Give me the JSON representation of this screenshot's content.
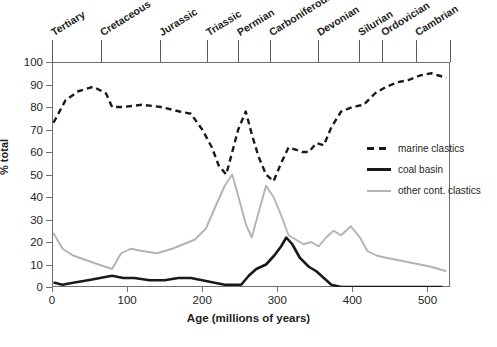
{
  "chart_data": {
    "type": "line",
    "title": "",
    "xlabel": "Age (millions of years)",
    "ylabel": "% total",
    "xlim": [
      0,
      530
    ],
    "ylim": [
      0,
      100
    ],
    "xticks": [
      0,
      100,
      200,
      300,
      400,
      500
    ],
    "yticks": [
      0,
      10,
      20,
      30,
      40,
      50,
      60,
      70,
      80,
      90,
      100
    ],
    "grid": false,
    "legend_position": "right-middle",
    "series": [
      {
        "name": "marine clastics",
        "style": "dashed",
        "color": "#1a1a1a",
        "x": [
          2,
          18,
          35,
          55,
          72,
          80,
          95,
          120,
          145,
          170,
          185,
          200,
          213,
          222,
          232,
          240,
          248,
          258,
          266,
          275,
          285,
          295,
          305,
          315,
          325,
          333,
          342,
          352,
          362,
          372,
          385,
          400,
          415,
          430,
          445,
          460,
          475,
          490,
          505,
          515,
          525
        ],
        "y": [
          73,
          83,
          87,
          89,
          86,
          80,
          80,
          81,
          80,
          78,
          77,
          70,
          62,
          54,
          50,
          60,
          70,
          78,
          68,
          58,
          50,
          47,
          55,
          62,
          61,
          60,
          60,
          64,
          63,
          71,
          78,
          80,
          81,
          86,
          89,
          91,
          92,
          94,
          95,
          94,
          93
        ]
      },
      {
        "name": "coal basin",
        "style": "solid",
        "color": "#1a1a1a",
        "x": [
          2,
          14,
          30,
          48,
          64,
          80,
          95,
          110,
          130,
          150,
          168,
          185,
          200,
          215,
          230,
          245,
          252,
          262,
          272,
          285,
          296,
          305,
          312,
          320,
          330,
          342,
          352,
          362,
          372,
          385,
          400,
          420,
          440,
          460,
          480,
          500,
          520
        ],
        "y": [
          2,
          1,
          2,
          3,
          4,
          5,
          4,
          4,
          3,
          3,
          4,
          4,
          3,
          2,
          1,
          1,
          1,
          5,
          8,
          10,
          14,
          18,
          22,
          19,
          13,
          9,
          7,
          4,
          1,
          0,
          0,
          0,
          0,
          0,
          0,
          0,
          0
        ]
      },
      {
        "name": "other cont. clastics",
        "style": "solid-gray",
        "color": "#b3b3b3",
        "x": [
          2,
          14,
          28,
          45,
          62,
          80,
          92,
          105,
          120,
          140,
          160,
          175,
          190,
          205,
          218,
          230,
          240,
          250,
          258,
          266,
          275,
          285,
          295,
          305,
          315,
          325,
          335,
          345,
          355,
          365,
          375,
          385,
          398,
          410,
          420,
          432,
          445,
          460,
          475,
          490,
          505,
          515,
          525
        ]
      }
    ],
    "other_cont_clastics_y": [
      24,
      17,
      14,
      12,
      10,
      8,
      15,
      17,
      16,
      15,
      17,
      19,
      21,
      26,
      36,
      45,
      50,
      38,
      28,
      22,
      33,
      45,
      40,
      32,
      23,
      21,
      19,
      20,
      18,
      22,
      25,
      23,
      27,
      22,
      16,
      14,
      13,
      12,
      11,
      10,
      9,
      8,
      7
    ]
  },
  "periods": {
    "labels": [
      {
        "name": "Tertiary",
        "start": 0,
        "end": 65
      },
      {
        "name": "Cretaceous",
        "start": 65,
        "end": 144
      },
      {
        "name": "Jurassic",
        "start": 144,
        "end": 206
      },
      {
        "name": "Triassic",
        "start": 206,
        "end": 248
      },
      {
        "name": "Permian",
        "start": 248,
        "end": 290
      },
      {
        "name": "Carboniferous",
        "start": 290,
        "end": 354
      },
      {
        "name": "Devonian",
        "start": 354,
        "end": 409
      },
      {
        "name": "Silurian",
        "start": 409,
        "end": 439
      },
      {
        "name": "Ordovician",
        "start": 439,
        "end": 485
      },
      {
        "name": "Cambrian",
        "start": 485,
        "end": 530
      }
    ]
  },
  "legend": {
    "items": [
      {
        "label": "marine clastics",
        "style": "dashed",
        "color": "#1a1a1a"
      },
      {
        "label": "coal basin",
        "style": "solid",
        "color": "#1a1a1a"
      },
      {
        "label": "other cont. clastics",
        "style": "solid-gray",
        "color": "#b3b3b3"
      }
    ]
  },
  "axes": {
    "y_title": "% total",
    "x_title": "Age (millions of years)"
  }
}
